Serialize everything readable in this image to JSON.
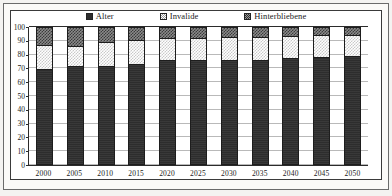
{
  "chart_data": {
    "type": "bar",
    "subtype": "stacked-100-percent",
    "title": "",
    "subtitle": "",
    "xlabel": "",
    "ylabel": "",
    "categories": [
      "2000",
      "2005",
      "2010",
      "2015",
      "2020",
      "2025",
      "2030",
      "2035",
      "2040",
      "2045",
      "2050"
    ],
    "series": [
      {
        "name": "Alter",
        "values": [
          69,
          71,
          71.5,
          73,
          75.5,
          76,
          76,
          76,
          77,
          78,
          78.5
        ],
        "color": "#2d2d2d",
        "pattern": "solid-dark"
      },
      {
        "name": "Invalide",
        "values": [
          18.5,
          16,
          18,
          18.5,
          17,
          17,
          17.5,
          17.5,
          17,
          16.5,
          16.5
        ],
        "color": "#c9c9c9",
        "pattern": "light-checker"
      },
      {
        "name": "Hinterbliebene",
        "values": [
          12.5,
          13,
          10.5,
          8.5,
          7.5,
          7,
          6.5,
          6.5,
          6,
          5.5,
          5
        ],
        "color": "#8a8a8a",
        "pattern": "dark-checker"
      }
    ],
    "cumulative_tops": {
      "alter": [
        69,
        71,
        71.5,
        73,
        75.5,
        76,
        76,
        76,
        77,
        78,
        78.5
      ],
      "alter_plus_invalide": [
        87.5,
        87,
        89.5,
        91.5,
        92.5,
        93,
        93.5,
        93.5,
        94,
        94.5,
        95
      ]
    },
    "ylim": [
      0,
      100
    ],
    "ytick_values": [
      0,
      10,
      20,
      30,
      40,
      50,
      60,
      70,
      80,
      90,
      100
    ],
    "ytick_labels": [
      "0",
      "10",
      "20",
      "30",
      "40",
      "50",
      "60",
      "70",
      "80",
      "90",
      "100"
    ],
    "grid": true,
    "grid_axis": "y",
    "legend_position": "top",
    "legend": [
      "Alter",
      "Invalide",
      "Hinterbliebene"
    ]
  },
  "legend": {
    "items": [
      {
        "label": "Alter",
        "swatch": "legend-swatch-alter-icon"
      },
      {
        "label": "Invalide",
        "swatch": "legend-swatch-invalide-icon"
      },
      {
        "label": "Hinterbliebene",
        "swatch": "legend-swatch-hinterbliebene-icon"
      }
    ]
  },
  "colors": {
    "alter": "#2d2d2d",
    "invalide": "#c9c9c9",
    "hinterbliebene": "#8a8a8a",
    "axis": "#2b2b2b",
    "grid": "#b9b9b9",
    "frame": "#3a3a3a",
    "page": "#f4f3f1"
  }
}
